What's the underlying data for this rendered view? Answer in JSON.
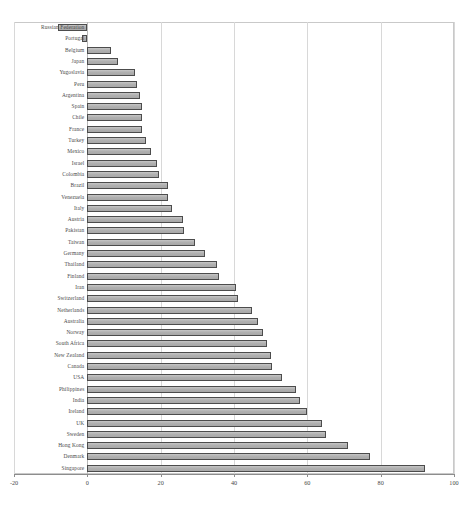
{
  "chart": {
    "title": "",
    "type": "bar",
    "orientation": "horizontal"
  },
  "axis": {
    "x_ticks": [
      "-20",
      "0",
      "20",
      "40",
      "60",
      "80",
      "100"
    ],
    "x_tick_values": [
      -20,
      0,
      20,
      40,
      60,
      80,
      100
    ],
    "xlim": [
      -20,
      100
    ],
    "xlabel": "",
    "ylabel": ""
  },
  "style": {
    "bar_fill": "#b5b5b5",
    "bar_border": "#4c4c4c",
    "grid_color": "#d8d8d8",
    "frame_color": "#c9c9c9",
    "text_color": "#4a4a4a"
  },
  "chart_data": {
    "type": "bar",
    "orientation": "horizontal",
    "title": "",
    "xlabel": "",
    "ylabel": "",
    "xlim": [
      -20,
      100
    ],
    "xticks": [
      -20,
      0,
      20,
      40,
      60,
      80,
      100
    ],
    "grid": true,
    "legend": null,
    "categories": [
      "Russian Federation",
      "Portugal",
      "Belgium",
      "Japan",
      "Yugoslavia",
      "Peru",
      "Argentina",
      "Spain",
      "Chile",
      "France",
      "Turkey",
      "Mexico",
      "Israel",
      "Colombia",
      "Brazil",
      "Venezuela",
      "Italy",
      "Austria",
      "Pakistan",
      "Taiwan",
      "Germany",
      "Thailand",
      "Finland",
      "Iran",
      "Switzerland",
      "Netherlands",
      "Australia",
      "Norway",
      "South Africa",
      "New Zealand",
      "Canada",
      "USA",
      "Philippines",
      "India",
      "Ireland",
      "UK",
      "Sweden",
      "Hong Kong",
      "Denmark",
      "Singapore"
    ],
    "values": [
      -8,
      -1.5,
      6.5,
      8.5,
      13,
      13.5,
      14.5,
      15,
      15,
      15,
      16,
      17.5,
      19,
      19.5,
      22,
      22,
      23,
      26,
      26.5,
      29.5,
      32,
      35.5,
      36,
      40.5,
      41,
      45,
      46.5,
      48,
      49,
      50,
      50.5,
      53,
      57,
      58,
      60,
      64,
      65,
      71,
      77,
      92
    ]
  }
}
